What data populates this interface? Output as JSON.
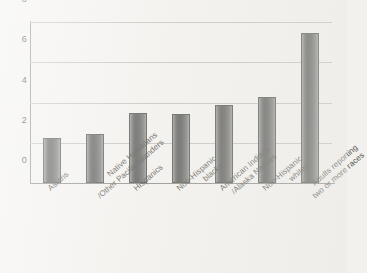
{
  "chart_data": {
    "type": "bar",
    "title": "",
    "subtitle": "",
    "xlabel": "",
    "ylabel": "",
    "ylim": [
      0,
      8
    ],
    "yticks": [
      "0",
      "2",
      "4",
      "6",
      "8"
    ],
    "ytick_values": [
      0,
      2,
      4,
      6,
      8
    ],
    "grid": true,
    "legend": false,
    "legend_position": "none",
    "categories": [
      "Asians",
      "Native Hawaiians /Other Pacific Islanders",
      "Hispanics",
      "Non-Hispanic blacks",
      "American Indians /Alaska Natives",
      "Non-Hispanic whites",
      "Adults reporting two or more races"
    ],
    "category_lines": [
      [
        "Asians"
      ],
      [
        "Native Hawaiians",
        "/Other Pacific Islanders"
      ],
      [
        "Hispanics"
      ],
      [
        "Non-Hispanic",
        "blacks"
      ],
      [
        "American Indians",
        "/Alaska Natives"
      ],
      [
        "Non-Hispanic",
        "whites"
      ],
      [
        "Adults reporting",
        "two or more races"
      ]
    ],
    "values": [
      2.25,
      2.45,
      3.5,
      3.45,
      3.9,
      4.25,
      7.45
    ],
    "series": [
      {
        "name": "",
        "values": [
          2.25,
          2.45,
          3.5,
          3.45,
          3.9,
          4.25,
          7.45
        ]
      }
    ],
    "bar_color": "#6a6a68",
    "bar_edge_color": "#54544f",
    "grid_color": "#c4c3bf",
    "axis_color": "#8d8d8a",
    "background_color": "#f3f2ef"
  }
}
